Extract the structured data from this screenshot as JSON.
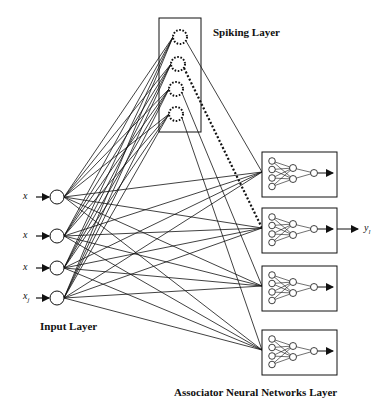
{
  "diagram": {
    "spiking_layer": {
      "title": "Spiking Layer",
      "neuron_count": 4,
      "style": "dotted circles"
    },
    "input_layer": {
      "title": "Input Layer",
      "inputs": [
        {
          "label": "x",
          "sub": ""
        },
        {
          "label": "x",
          "sub": ""
        },
        {
          "label": "x",
          "sub": ""
        },
        {
          "label": "x",
          "sub": "j"
        }
      ]
    },
    "associator_layer": {
      "title": "Associator Neural Networks Layer",
      "network_count": 4,
      "network_structure": {
        "inputs": 4,
        "hidden": 2,
        "outputs": 1
      }
    },
    "output": {
      "label": "y",
      "sub": "l"
    },
    "colors": {
      "line": "#111111",
      "background": "#ffffff"
    }
  }
}
